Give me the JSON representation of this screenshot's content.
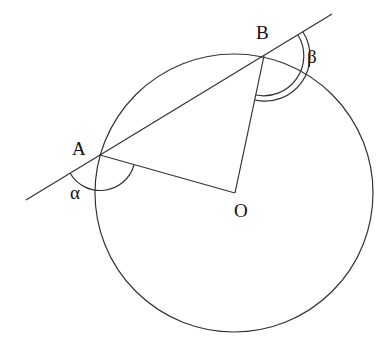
{
  "diagram": {
    "type": "geometry",
    "labels": {
      "A": "A",
      "B": "B",
      "O": "O",
      "alpha": "α",
      "beta": "β"
    },
    "points": {
      "A": [
        100,
        155
      ],
      "B": [
        264,
        56
      ],
      "O": [
        235,
        193
      ]
    },
    "circle": {
      "center": [
        234,
        193
      ],
      "radius": 139
    },
    "secant_line": {
      "from": [
        26,
        200
      ],
      "to": [
        332,
        14
      ]
    },
    "angles": [
      {
        "name": "alpha",
        "vertex": "A",
        "arcs": 1,
        "between": [
          "secant (lower-left)",
          "AO"
        ]
      },
      {
        "name": "beta",
        "vertex": "B",
        "arcs": 2,
        "between": [
          "secant (upper-right)",
          "BO"
        ]
      }
    ]
  }
}
